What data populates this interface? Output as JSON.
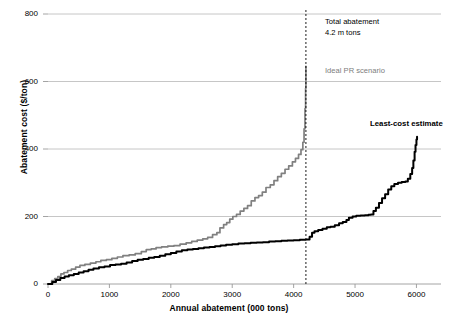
{
  "chart_data": {
    "type": "line",
    "title": "",
    "xlabel": "Annual abatement (000 tons)",
    "ylabel": "Abatement cost ($/ton)",
    "xlim": [
      0,
      6400
    ],
    "ylim": [
      0,
      800
    ],
    "xticks": [
      0,
      1000,
      2000,
      3000,
      4000,
      5000,
      6000
    ],
    "yticks": [
      0,
      200,
      400,
      600,
      800
    ],
    "grid": "horizontal",
    "legend_position": "inline-annotations",
    "series": [
      {
        "name": "Ideal PR scenario",
        "color": "#808080",
        "label_text": "Ideal PR scenario",
        "points": [
          [
            0,
            0
          ],
          [
            60,
            10
          ],
          [
            110,
            16
          ],
          [
            160,
            22
          ],
          [
            210,
            30
          ],
          [
            260,
            34
          ],
          [
            320,
            40
          ],
          [
            380,
            44
          ],
          [
            450,
            50
          ],
          [
            520,
            55
          ],
          [
            600,
            58
          ],
          [
            690,
            62
          ],
          [
            780,
            66
          ],
          [
            860,
            70
          ],
          [
            950,
            72
          ],
          [
            1040,
            76
          ],
          [
            1130,
            80
          ],
          [
            1220,
            84
          ],
          [
            1320,
            86
          ],
          [
            1420,
            90
          ],
          [
            1520,
            96
          ],
          [
            1600,
            102
          ],
          [
            1680,
            104
          ],
          [
            1760,
            108
          ],
          [
            1850,
            110
          ],
          [
            1950,
            112
          ],
          [
            2050,
            114
          ],
          [
            2150,
            118
          ],
          [
            2250,
            122
          ],
          [
            2340,
            126
          ],
          [
            2430,
            130
          ],
          [
            2520,
            134
          ],
          [
            2600,
            138
          ],
          [
            2680,
            146
          ],
          [
            2750,
            152
          ],
          [
            2800,
            166
          ],
          [
            2860,
            176
          ],
          [
            2910,
            182
          ],
          [
            2960,
            192
          ],
          [
            3010,
            200
          ],
          [
            3070,
            206
          ],
          [
            3130,
            216
          ],
          [
            3190,
            224
          ],
          [
            3250,
            232
          ],
          [
            3310,
            246
          ],
          [
            3370,
            256
          ],
          [
            3430,
            262
          ],
          [
            3490,
            272
          ],
          [
            3550,
            286
          ],
          [
            3620,
            294
          ],
          [
            3680,
            306
          ],
          [
            3740,
            318
          ],
          [
            3800,
            328
          ],
          [
            3860,
            340
          ],
          [
            3920,
            350
          ],
          [
            3980,
            362
          ],
          [
            4030,
            372
          ],
          [
            4080,
            384
          ],
          [
            4120,
            398
          ],
          [
            4150,
            420
          ],
          [
            4170,
            460
          ],
          [
            4185,
            520
          ],
          [
            4195,
            580
          ],
          [
            4200,
            645
          ]
        ]
      },
      {
        "name": "Least-cost estimate",
        "color": "#000000",
        "label_text": "Least-cost estimate",
        "points": [
          [
            0,
            0
          ],
          [
            70,
            6
          ],
          [
            130,
            12
          ],
          [
            200,
            18
          ],
          [
            270,
            22
          ],
          [
            340,
            26
          ],
          [
            420,
            30
          ],
          [
            500,
            34
          ],
          [
            580,
            38
          ],
          [
            660,
            42
          ],
          [
            740,
            46
          ],
          [
            830,
            50
          ],
          [
            920,
            52
          ],
          [
            1010,
            56
          ],
          [
            1100,
            58
          ],
          [
            1190,
            60
          ],
          [
            1280,
            64
          ],
          [
            1370,
            68
          ],
          [
            1460,
            72
          ],
          [
            1550,
            74
          ],
          [
            1640,
            78
          ],
          [
            1730,
            80
          ],
          [
            1820,
            84
          ],
          [
            1910,
            88
          ],
          [
            2000,
            92
          ],
          [
            2090,
            96
          ],
          [
            2180,
            100
          ],
          [
            2270,
            102
          ],
          [
            2360,
            104
          ],
          [
            2450,
            106
          ],
          [
            2540,
            108
          ],
          [
            2630,
            110
          ],
          [
            2720,
            112
          ],
          [
            2810,
            114
          ],
          [
            2900,
            116
          ],
          [
            3000,
            118
          ],
          [
            3100,
            120
          ],
          [
            3200,
            121
          ],
          [
            3300,
            122
          ],
          [
            3400,
            123
          ],
          [
            3500,
            124
          ],
          [
            3600,
            126
          ],
          [
            3700,
            127
          ],
          [
            3800,
            128
          ],
          [
            3900,
            129
          ],
          [
            4000,
            130
          ],
          [
            4100,
            131
          ],
          [
            4200,
            132
          ],
          [
            4260,
            140
          ],
          [
            4300,
            152
          ],
          [
            4340,
            156
          ],
          [
            4400,
            160
          ],
          [
            4470,
            164
          ],
          [
            4540,
            168
          ],
          [
            4600,
            170
          ],
          [
            4670,
            174
          ],
          [
            4740,
            180
          ],
          [
            4800,
            184
          ],
          [
            4860,
            190
          ],
          [
            4900,
            196
          ],
          [
            4960,
            200
          ],
          [
            5020,
            202
          ],
          [
            5090,
            203
          ],
          [
            5160,
            204
          ],
          [
            5220,
            205
          ],
          [
            5260,
            206
          ],
          [
            5300,
            216
          ],
          [
            5340,
            226
          ],
          [
            5390,
            240
          ],
          [
            5440,
            254
          ],
          [
            5490,
            266
          ],
          [
            5540,
            280
          ],
          [
            5590,
            290
          ],
          [
            5640,
            296
          ],
          [
            5700,
            300
          ],
          [
            5760,
            302
          ],
          [
            5820,
            304
          ],
          [
            5860,
            312
          ],
          [
            5900,
            326
          ],
          [
            5930,
            344
          ],
          [
            5950,
            366
          ],
          [
            5970,
            392
          ],
          [
            5985,
            412
          ],
          [
            6000,
            428
          ],
          [
            6010,
            436
          ]
        ]
      }
    ],
    "annotations": [
      {
        "name": "total-abatement",
        "line1": "Total abatement",
        "line2": "4.2 m tons",
        "x": 4200,
        "style": "dashed-vertical"
      }
    ],
    "vertical_line": {
      "x": 4200,
      "color": "#000000",
      "dash": "2,2"
    }
  }
}
